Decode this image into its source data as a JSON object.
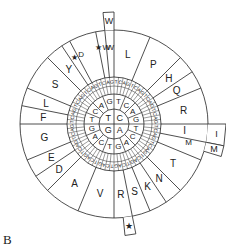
{
  "figure": {
    "panel_label": "B",
    "ring1": [
      "T",
      "C",
      "A",
      "G"
    ],
    "ring2": [
      "T",
      "C",
      "A",
      "G",
      "T",
      "C",
      "A",
      "G",
      "T",
      "C",
      "A",
      "G",
      "T",
      "C",
      "A",
      "G"
    ],
    "ring3_pattern": [
      "T",
      "C",
      "A",
      "G"
    ],
    "amino_acids": [
      {
        "label": "F",
        "start": 0,
        "span": 2
      },
      {
        "label": "L",
        "start": 2,
        "span": 2
      },
      {
        "label": "S",
        "start": 4,
        "span": 4
      },
      {
        "label": "Y",
        "start": 8,
        "span": 2
      },
      {
        "label": "★",
        "start": 10,
        "span": 1
      },
      {
        "label": "D",
        "start": 11,
        "span": 1,
        "note": "stop in standard code"
      },
      {
        "label": "★W",
        "start": 14,
        "span": 1
      },
      {
        "label": "W",
        "start": 15,
        "span": 1
      },
      {
        "label": "L",
        "start": 16,
        "span": 4
      },
      {
        "label": "P",
        "start": 20,
        "span": 4
      },
      {
        "label": "H",
        "start": 24,
        "span": 2
      },
      {
        "label": "Q",
        "start": 26,
        "span": 2
      },
      {
        "label": "R",
        "start": 28,
        "span": 4
      },
      {
        "label": "I",
        "start": 32,
        "span": 2
      },
      {
        "label": "M",
        "start": 34,
        "span": 1
      },
      {
        "label": "T",
        "start": 36,
        "span": 4
      },
      {
        "label": "N",
        "start": 40,
        "span": 2
      },
      {
        "label": "K",
        "start": 42,
        "span": 2
      },
      {
        "label": "S",
        "start": 44,
        "span": 2
      },
      {
        "label": "R",
        "start": 46,
        "span": 2
      },
      {
        "label": "V",
        "start": 48,
        "span": 4
      },
      {
        "label": "A",
        "start": 52,
        "span": 4
      },
      {
        "label": "D",
        "start": 56,
        "span": 2
      },
      {
        "label": "E",
        "start": 58,
        "span": 2
      },
      {
        "label": "G",
        "start": 60,
        "span": 4
      }
    ],
    "outer_tabs": [
      {
        "label": "W",
        "position": "top"
      },
      {
        "label": "I",
        "position": "right-upper"
      },
      {
        "label": "M",
        "position": "right-lower"
      },
      {
        "label": "★",
        "position": "bottom"
      }
    ],
    "colors": {
      "line": "#222222",
      "background": "#ffffff"
    }
  }
}
